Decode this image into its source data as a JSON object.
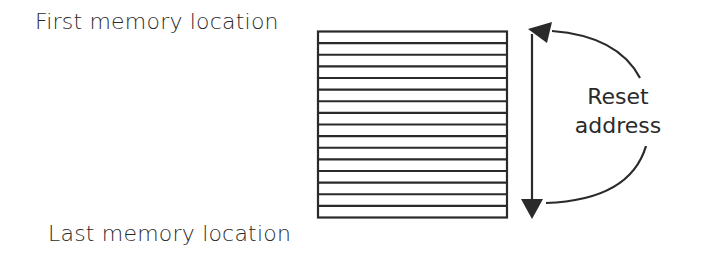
{
  "labels": {
    "first": "First memory location",
    "last": "Last memory location",
    "reset_line1": "Reset",
    "reset_line2": "address"
  },
  "memory_block": {
    "rows": 16
  },
  "colors": {
    "stroke": "#2a2a2a",
    "background": "#ffffff"
  }
}
